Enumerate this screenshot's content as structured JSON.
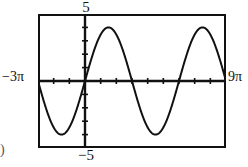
{
  "figure": {
    "name": "trig-function-graph",
    "choice_marker": ")",
    "axis_labels": {
      "y_max": "5",
      "y_min": "−5",
      "x_min": "−3π",
      "x_max": "9π"
    }
  },
  "chart_data": {
    "type": "line",
    "title": "",
    "subtitle": "",
    "xlabel": "",
    "ylabel": "",
    "xlim": [
      -9.42477796,
      28.27433388
    ],
    "ylim": [
      -5,
      5
    ],
    "xlim_labels": [
      "−3π",
      "9π"
    ],
    "ylim_labels": [
      "−5",
      "5"
    ],
    "grid": false,
    "legend": null,
    "axis_style": "calculator-window",
    "x_tick_label_values": [
      "−3π",
      "9π"
    ],
    "y_tick_label_values": [
      "5",
      "−5"
    ],
    "x_tick_spacing": 3.14159265,
    "x_tick_spacing_label": "π",
    "y_tick_spacing": 1,
    "n_x_ticks": 12,
    "n_y_ticks": 10,
    "series": [
      {
        "name": "y = 4 sin(x/3)",
        "function": "4*sin(x/3)",
        "amplitude": 4,
        "period": 18.8495559,
        "period_label": "6π",
        "phase_shift": 0,
        "vertical_shift": 0,
        "color": "#111111",
        "linewidth": 2,
        "style": "solid",
        "n_periods_shown": 2,
        "x": [
          -9.4248,
          -8.4823,
          -7.5398,
          -6.5973,
          -5.6549,
          -4.7124,
          -3.7699,
          -2.8274,
          -1.885,
          -0.9425,
          0,
          0.9425,
          1.885,
          2.8274,
          3.7699,
          4.7124,
          5.6549,
          6.5973,
          7.5398,
          8.4823,
          9.4248,
          10.3673,
          11.3097,
          12.2522,
          13.1947,
          14.1372,
          15.0796,
          16.0221,
          16.9646,
          17.9071,
          18.8496,
          19.792,
          20.7345,
          21.677,
          22.6195,
          23.5619,
          24.5044,
          25.4469,
          26.3894,
          27.3319,
          28.2743
        ],
        "y": [
          0,
          1.236,
          2.351,
          3.236,
          3.804,
          4,
          3.804,
          3.236,
          2.351,
          1.236,
          0,
          -1.236,
          -2.351,
          -3.236,
          -3.804,
          -4,
          -3.804,
          -3.236,
          -2.351,
          -1.236,
          0,
          1.236,
          2.351,
          3.236,
          3.804,
          4,
          3.804,
          3.236,
          2.351,
          1.236,
          0,
          -1.236,
          -2.351,
          -3.236,
          -3.804,
          -4,
          -3.804,
          -3.236,
          -2.351,
          -1.236,
          0
        ],
        "key_points": {
          "maxima_x": [
            -4.7124,
            14.1372
          ],
          "maxima_x_labels": [
            "−3π/2",
            "9π/2"
          ],
          "minima_x": [
            4.7124,
            23.5619
          ],
          "minima_x_labels": [
            "3π/2",
            "15π/2"
          ],
          "zeros_x": [
            -9.4248,
            0,
            9.4248,
            18.8496,
            28.2743
          ],
          "zeros_x_labels": [
            "−3π",
            "0",
            "3π",
            "6π",
            "9π"
          ],
          "max_value": 4,
          "min_value": -4
        }
      }
    ]
  }
}
